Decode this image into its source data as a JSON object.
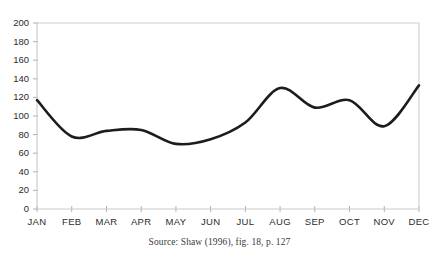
{
  "chart_data": {
    "type": "line",
    "title": "",
    "xlabel": "",
    "ylabel": "",
    "categories": [
      "JAN",
      "FEB",
      "MAR",
      "APR",
      "MAY",
      "JUN",
      "JUL",
      "AUG",
      "SEP",
      "OCT",
      "NOV",
      "DEC"
    ],
    "values": [
      117,
      78,
      84,
      85,
      70,
      75,
      93,
      130,
      109,
      117,
      89,
      133
    ],
    "series": [
      {
        "name": "",
        "values": [
          117,
          78,
          84,
          85,
          70,
          75,
          93,
          130,
          109,
          117,
          89,
          133
        ]
      }
    ],
    "ylim": [
      0,
      200
    ],
    "yticks": [
      0,
      20,
      40,
      60,
      80,
      100,
      120,
      140,
      160,
      180,
      200
    ],
    "ytick_labels": [
      "0",
      "20",
      "40",
      "60",
      "80",
      "100",
      "120",
      "140",
      "160",
      "180",
      "200"
    ],
    "grid": false,
    "legend": false,
    "line_color": "#1c1c1c",
    "axis_color": "#c9c9c9",
    "smoothing": "spline"
  },
  "caption": {
    "source_text": "Source: Shaw (1996), fig. 18, p. 127"
  }
}
